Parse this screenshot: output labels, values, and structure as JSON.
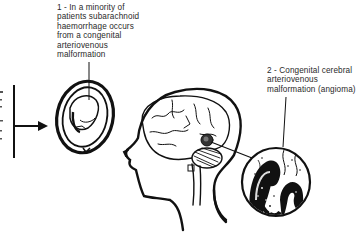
{
  "diagram": {
    "labels": [
      {
        "id": "label-1",
        "number": "1",
        "text": "1 - In a minority of\npatients subarachnoid\nhaemorrhage occurs\nfrom a congenital\narteriovenous\nmalformation"
      },
      {
        "id": "label-2",
        "number": "2",
        "text": "2 - Congenital cerebral\narteriovenous\nmalformation (angioma)"
      }
    ],
    "illustrations": [
      {
        "name": "brain-cross-section-oval",
        "description": "Oval cross-section of head showing haemorrhage"
      },
      {
        "name": "head-profile-with-brain",
        "description": "Side profile of head showing brain, cerebellum and lesion"
      },
      {
        "name": "magnified-angioma-circle",
        "description": "Magnified circular inset of tangled malformed vessels"
      }
    ],
    "connectors": [
      {
        "from": "left-bracket",
        "to": "brain-cross-section-oval",
        "type": "arrow"
      },
      {
        "from": "label-1",
        "to": "brain-cross-section-oval",
        "type": "pointer-line"
      },
      {
        "from": "label-2",
        "to": "magnified-angioma-circle",
        "type": "pointer-line"
      },
      {
        "from": "brain-lesion",
        "to": "magnified-angioma-circle",
        "type": "pointer-line"
      }
    ],
    "colors": {
      "ink": "#111111",
      "text": "#2a2a2a",
      "background": "#ffffff"
    }
  }
}
